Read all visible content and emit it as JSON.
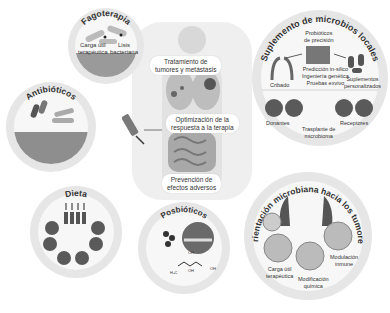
{
  "center": {
    "labels": [
      "Tratamiento de tumores y metástasis",
      "Optimización de la respuesta a la terapia",
      "Prevención de efectos adversos"
    ],
    "label_lines": [
      [
        "Tratamiento de",
        "tumores y metástasis"
      ],
      [
        "Optimización de la",
        "respuesta a la terapia"
      ],
      [
        "Prevención de",
        "efectos adversos"
      ]
    ]
  },
  "panels": {
    "fagoterapia": {
      "title": "Fagoterapia",
      "labels": [
        [
          "Carga útil",
          "terapéutica"
        ],
        [
          "Lisis",
          "bacteriana"
        ]
      ]
    },
    "antibioticos": {
      "title": "Antibióticos"
    },
    "dieta": {
      "title": "Dieta",
      "icons": [
        "apple-icon",
        "burger-icon",
        "ice-cream-icon",
        "fish-icon",
        "chicken-leg-icon",
        "bread-icon"
      ],
      "arrows": [
        "down",
        "up",
        "down",
        "up"
      ]
    },
    "posbioticos": {
      "title": "Posbióticos",
      "chem": [
        "OH",
        "H3C",
        "OH",
        "OH"
      ]
    },
    "suplemento": {
      "title": "Suplemento de microbios locales",
      "labels": {
        "probioticos": [
          "Probióticos",
          "de precisión"
        ],
        "cribado": "Cribado",
        "prediccion": [
          "Predicción in-silico",
          "Ingeniería genética",
          "Pruebas exvivo"
        ],
        "suplementos": [
          "Suplementos",
          "personalizados"
        ],
        "donantes": "Donantes",
        "receptores": "Receptores",
        "trasplante": [
          "Trasplante de",
          "microbioma"
        ]
      }
    },
    "orientacion": {
      "title": "Orientación microbiana hacia los tumores",
      "labels": {
        "carga": [
          "Carga útil",
          "terapéutica"
        ],
        "modificacion": [
          "Modificación",
          "química"
        ],
        "modulacion": [
          "Modulación",
          "inmune"
        ]
      }
    }
  }
}
